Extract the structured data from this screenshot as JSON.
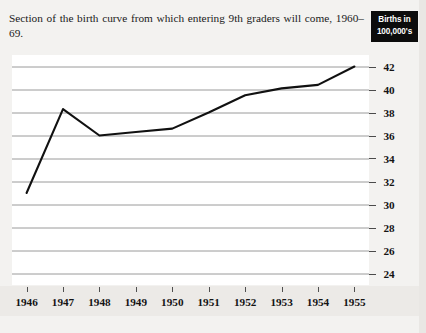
{
  "chart_data": {
    "type": "line",
    "title": "Section of the birth curve from which entering 9th graders will come, 1960–69.",
    "xlabel": "",
    "ylabel": "Births in 100,000's",
    "legend_label_line1": "Births in",
    "legend_label_line2": "100,000's",
    "x": [
      1946,
      1947,
      1948,
      1949,
      1950,
      1951,
      1952,
      1953,
      1954,
      1955
    ],
    "xtick_labels": [
      "1946",
      "1947",
      "1948",
      "1949",
      "1950",
      "1951",
      "1952",
      "1953",
      "1954",
      "1955"
    ],
    "values": [
      31.0,
      38.3,
      36.0,
      36.3,
      36.6,
      38.0,
      39.5,
      40.1,
      40.4,
      42.0
    ],
    "ytick_labels": [
      "42",
      "40",
      "38",
      "36",
      "34",
      "32",
      "30",
      "28",
      "26",
      "24"
    ],
    "yticks": [
      42,
      40,
      38,
      36,
      34,
      32,
      30,
      28,
      26,
      24
    ],
    "ylim": [
      23,
      43
    ],
    "xlim": [
      1945.6,
      1955.4
    ],
    "grid": true,
    "grid_axis": "y",
    "legend_position": "top-right",
    "line_color": "#111111",
    "grid_color": "#9a9a9a",
    "background_color": "#ffffff"
  }
}
